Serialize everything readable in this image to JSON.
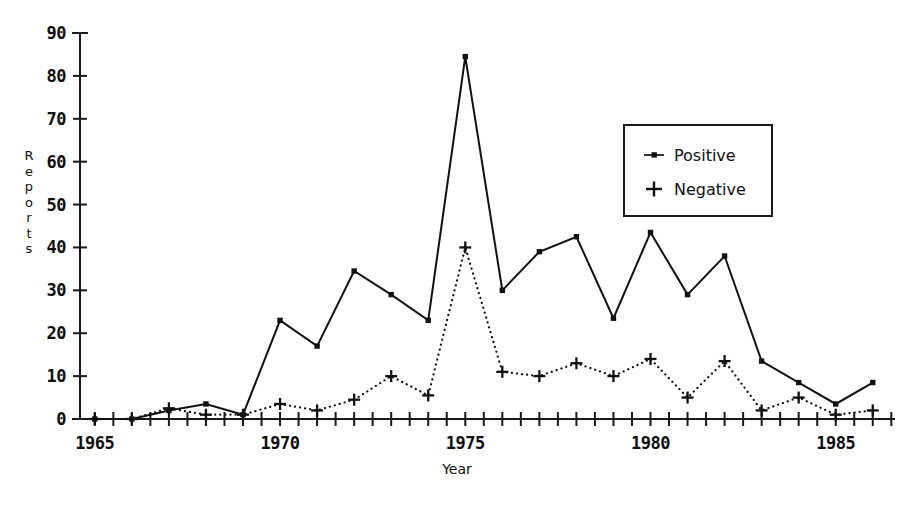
{
  "chart_data": {
    "type": "line",
    "title": "",
    "xlabel": "Year",
    "ylabel": "Reports",
    "ylabel_chars": [
      "R",
      "e",
      "p",
      "o",
      "r",
      "t",
      "s"
    ],
    "xlim": [
      1964.6,
      1986.6
    ],
    "ylim": [
      0,
      90
    ],
    "grid": false,
    "legend_position": "upper right",
    "yticks": [
      0,
      10,
      20,
      30,
      40,
      50,
      60,
      70,
      80,
      90
    ],
    "ytick_labels": [
      "0",
      "10",
      "20",
      "30",
      "40",
      "50",
      "60",
      "70",
      "80",
      "90"
    ],
    "xticks_labeled": [
      1965,
      1970,
      1975,
      1980,
      1985
    ],
    "xtick_labels": [
      "1965",
      "1970",
      "1975",
      "1980",
      "1985"
    ],
    "xtick_minor_step": 0.5,
    "x": [
      1965,
      1966,
      1967,
      1968,
      1969,
      1970,
      1971,
      1972,
      1973,
      1974,
      1975,
      1976,
      1977,
      1978,
      1979,
      1980,
      1981,
      1982,
      1983,
      1984,
      1985,
      1986
    ],
    "series": [
      {
        "name": "Positive",
        "marker": "square",
        "linestyle": "solid",
        "color": "#111111",
        "values": [
          0,
          0,
          2,
          3.5,
          1,
          23,
          17,
          34.5,
          29,
          23,
          84.5,
          30,
          39,
          42.5,
          23.5,
          43.5,
          29,
          38,
          13.5,
          8.5,
          3.5,
          8.5
        ]
      },
      {
        "name": "Negative",
        "marker": "plus",
        "linestyle": "dotted",
        "color": "#111111",
        "values": [
          0,
          0,
          2.5,
          1,
          1,
          3.5,
          2,
          4.5,
          10,
          5.5,
          40,
          11,
          10,
          13,
          10,
          14,
          5,
          13.5,
          2,
          5,
          1,
          2
        ]
      }
    ]
  },
  "legend": {
    "entries": [
      {
        "label": "Positive",
        "key": "square-line-key"
      },
      {
        "label": "Negative",
        "key": "plus-marker-key"
      }
    ]
  },
  "axis": {
    "x_title": "Year",
    "y_title": "Reports"
  },
  "colors": {
    "foreground": "#111111",
    "background": "#ffffff",
    "axis": "#1a1a1a"
  }
}
